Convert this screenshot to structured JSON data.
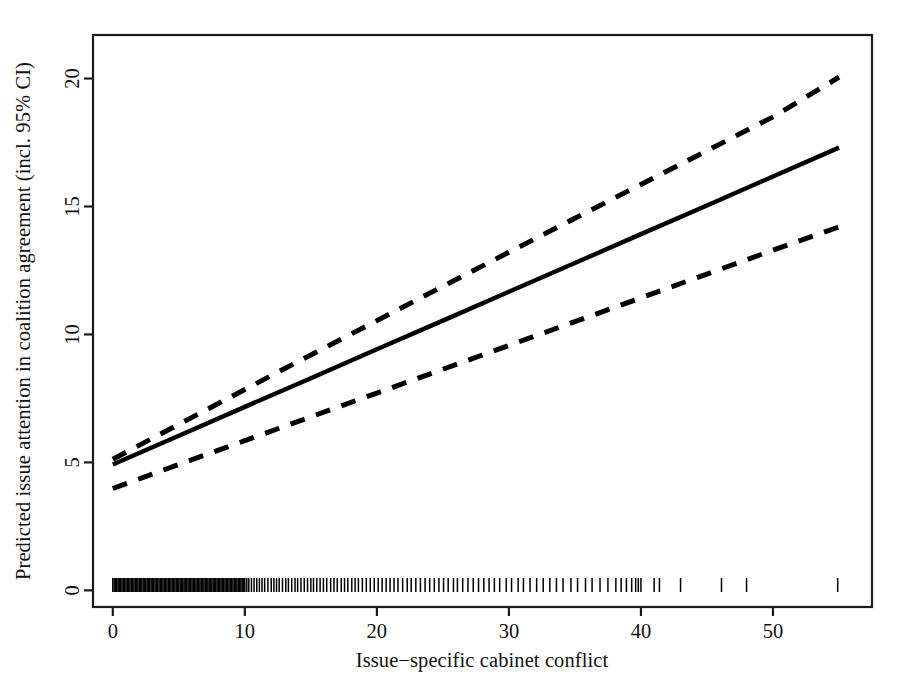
{
  "chart_data": {
    "type": "line",
    "title": "",
    "subtitle": "",
    "xlabel": "Issue−specific cabinet conflict",
    "ylabel": "Predicted issue attention in coalition agreement (incl. 95% CI)",
    "xlim": [
      -1.5,
      57.5
    ],
    "ylim": [
      -0.65,
      21.7
    ],
    "xticks": [
      0,
      10,
      20,
      30,
      40,
      50
    ],
    "xtick_labels": [
      "0",
      "10",
      "20",
      "30",
      "40",
      "50"
    ],
    "yticks": [
      0,
      5,
      10,
      15,
      20
    ],
    "ytick_labels": [
      "0",
      "5",
      "10",
      "15",
      "20"
    ],
    "grid": false,
    "legend": null,
    "legend_position": "none",
    "box_frame": true,
    "line_color": "#000000",
    "series": [
      {
        "name": "Predicted issue attention (fit)",
        "style": "solid",
        "x": [
          0,
          5,
          10,
          15,
          20,
          25,
          30,
          35,
          40,
          45,
          50,
          55
        ],
        "values": [
          4.92,
          6.04,
          7.17,
          8.29,
          9.42,
          10.54,
          11.67,
          12.79,
          13.92,
          15.04,
          16.17,
          17.3
        ]
      },
      {
        "name": "Upper 95% CI",
        "style": "dashed",
        "x": [
          0,
          5,
          10,
          15,
          20,
          25,
          30,
          35,
          40,
          45,
          50,
          55
        ],
        "values": [
          5.12,
          6.49,
          7.85,
          9.2,
          10.54,
          11.88,
          13.21,
          14.54,
          15.86,
          17.18,
          18.5,
          20.05
        ]
      },
      {
        "name": "Lower 95% CI",
        "style": "dashed",
        "x": [
          0,
          5,
          10,
          15,
          20,
          25,
          30,
          35,
          40,
          45,
          50,
          55
        ],
        "values": [
          3.98,
          4.92,
          5.85,
          6.78,
          7.71,
          8.64,
          9.57,
          10.5,
          11.43,
          12.36,
          13.29,
          14.2
        ]
      }
    ],
    "rug": {
      "name": "Observation rug (x distribution)",
      "axis": "x",
      "position": "bottom",
      "note": "Dense, near-solid band of observations from 0 to ~10, thinning steadily out to ~55",
      "values": [
        0,
        0.1,
        0.2,
        0.3,
        0.4,
        0.5,
        0.6,
        0.7,
        0.8,
        0.9,
        1.0,
        1.1,
        1.2,
        1.3,
        1.4,
        1.5,
        1.6,
        1.7,
        1.8,
        1.9,
        2.0,
        2.1,
        2.2,
        2.3,
        2.4,
        2.5,
        2.6,
        2.7,
        2.8,
        2.9,
        3.0,
        3.1,
        3.2,
        3.3,
        3.4,
        3.5,
        3.6,
        3.7,
        3.8,
        3.9,
        4.0,
        4.1,
        4.2,
        4.3,
        4.4,
        4.5,
        4.6,
        4.7,
        4.8,
        4.9,
        5.0,
        5.1,
        5.2,
        5.3,
        5.4,
        5.5,
        5.6,
        5.7,
        5.8,
        5.9,
        6.0,
        6.1,
        6.2,
        6.3,
        6.4,
        6.5,
        6.6,
        6.7,
        6.8,
        6.9,
        7.0,
        7.1,
        7.2,
        7.3,
        7.4,
        7.5,
        7.6,
        7.7,
        7.8,
        7.9,
        8.0,
        8.1,
        8.2,
        8.3,
        8.4,
        8.5,
        8.6,
        8.7,
        8.8,
        8.9,
        9.0,
        9.1,
        9.2,
        9.3,
        9.4,
        9.5,
        9.6,
        9.7,
        9.8,
        9.9,
        10.0,
        10.15,
        10.3,
        10.5,
        10.7,
        10.9,
        11.1,
        11.3,
        11.5,
        11.75,
        12.0,
        12.2,
        12.4,
        12.6,
        12.85,
        13.1,
        13.3,
        13.55,
        13.8,
        14.0,
        14.25,
        14.5,
        14.75,
        15.0,
        15.2,
        15.45,
        15.7,
        15.95,
        16.2,
        16.5,
        16.75,
        17.0,
        17.3,
        17.55,
        17.8,
        18.1,
        18.35,
        18.6,
        18.9,
        19.2,
        19.5,
        19.8,
        20.1,
        20.4,
        20.7,
        21.0,
        21.3,
        21.6,
        21.95,
        22.3,
        22.6,
        22.95,
        23.3,
        23.65,
        24.0,
        24.35,
        24.7,
        25.05,
        25.4,
        25.8,
        26.1,
        26.5,
        26.9,
        27.3,
        27.7,
        28.1,
        28.5,
        28.9,
        29.3,
        29.8,
        30.2,
        30.7,
        31.1,
        31.6,
        32.1,
        32.6,
        33.1,
        33.6,
        34.1,
        34.7,
        35.2,
        35.8,
        36.3,
        36.9,
        37.5,
        38.1,
        38.5,
        38.9,
        39.3,
        39.6,
        39.8,
        40.0,
        41.0,
        41.4,
        43.0,
        46.1,
        48.0,
        54.9
      ]
    }
  },
  "axes": {
    "x_tick_count": 6,
    "y_tick_count": 5,
    "tick_length_px": 9,
    "frame_color": "#1a1a1a"
  }
}
